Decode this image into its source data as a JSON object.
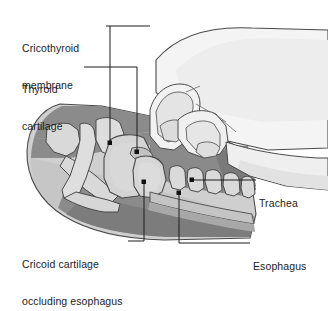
{
  "figure": {
    "background_color": "#ffffff",
    "line_color": "#1c1c1c",
    "text_color": "#1c1c1c",
    "palette": {
      "skin_light": "#f2f2f2",
      "skin_shadow": "#e2e2e2",
      "tissue_light": "#c9c9c9",
      "tissue_mid": "#b3b3b3",
      "tissue_dark": "#8f8f8f",
      "muscle_dark": "#7e7e7e",
      "cartilage": "#d2d2d2",
      "bone": "#dcdcdc",
      "outline": "#4a4a4a"
    }
  },
  "labels": [
    {
      "id": "cricothyroid-membrane",
      "text": "Cricothyroid\nmembrane",
      "line1": "Cricothyroid",
      "line2": "membrane",
      "position": "top-left",
      "leader_dot": {
        "x": 110,
        "y": 143
      }
    },
    {
      "id": "thyroid-cartilage",
      "text": "Thyroid\ncartilage",
      "line1": "Thyroid",
      "line2": "cartilage",
      "position": "upper-left",
      "leader_dot": {
        "x": 137,
        "y": 152
      }
    },
    {
      "id": "cricoid-cartilage-occluding-esophagus",
      "text": "Cricoid cartilage\noccluding esophagus",
      "line1": "Cricoid cartilage",
      "line2": "occluding esophagus",
      "position": "bottom-left",
      "leader_dot": {
        "x": 144,
        "y": 182
      }
    },
    {
      "id": "trachea",
      "text": "Trachea",
      "line1": "Trachea",
      "line2": "",
      "position": "right",
      "leader_dot": {
        "x": 192,
        "y": 180
      }
    },
    {
      "id": "esophagus",
      "text": "Esophagus",
      "line1": "Esophagus",
      "line2": "",
      "position": "bottom-right",
      "leader_dot": {
        "x": 179,
        "y": 193
      }
    }
  ],
  "anatomy": [
    {
      "id": "head-neck-profile",
      "name": "head-and-neck-profile"
    },
    {
      "id": "mandible",
      "name": "mandible"
    },
    {
      "id": "hyoid-bone",
      "name": "hyoid-bone"
    },
    {
      "id": "thyroid-cartilage-shape",
      "name": "thyroid-cartilage"
    },
    {
      "id": "cricothyroid-membrane-shape",
      "name": "cricothyroid-membrane"
    },
    {
      "id": "cricoid-cartilage-shape",
      "name": "cricoid-cartilage"
    },
    {
      "id": "tracheal-rings",
      "name": "tracheal-rings",
      "count": 5
    },
    {
      "id": "esophagus-band",
      "name": "esophagus"
    },
    {
      "id": "hand",
      "name": "hand-applying-cricoid-pressure"
    },
    {
      "id": "thumb",
      "name": "thumb"
    },
    {
      "id": "index-finger",
      "name": "index-finger"
    }
  ]
}
